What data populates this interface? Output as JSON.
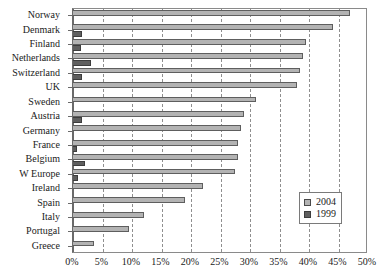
{
  "chart_data": {
    "type": "bar",
    "orientation": "horizontal",
    "title": "",
    "subtitle": "",
    "xlabel": "",
    "ylabel": "",
    "xlim": [
      0,
      50
    ],
    "xtick_step": 5,
    "grid": true,
    "grid_style": "dashed-vertical",
    "legend_position": "bottom-right",
    "categories": [
      "Norway",
      "Denmark",
      "Finland",
      "Netherlands",
      "Switzerland",
      "UK",
      "Sweden",
      "Austria",
      "Germany",
      "France",
      "Belgium",
      "W Europe",
      "Ireland",
      "Spain",
      "Italy",
      "Portugal",
      "Greece"
    ],
    "xticklabels": [
      "0%",
      "5%",
      "10%",
      "15%",
      "20%",
      "25%",
      "30%",
      "35%",
      "40%",
      "45%",
      "50%"
    ],
    "xtickvalues": [
      0,
      5,
      10,
      15,
      20,
      25,
      30,
      35,
      40,
      45,
      50
    ],
    "series": [
      {
        "name": "2004",
        "color": "#b3b3b3",
        "border_color": "#5e5e5e",
        "values": [
          47.0,
          44.0,
          39.5,
          39.0,
          38.5,
          38.0,
          31.0,
          29.0,
          28.5,
          28.0,
          28.0,
          27.5,
          22.0,
          19.0,
          12.0,
          9.5,
          3.5
        ]
      },
      {
        "name": "1999",
        "color": "#5f5f5f",
        "border_color": "#3d3d3d",
        "values": [
          0.0,
          1.5,
          1.3,
          3.0,
          1.6,
          0.0,
          0.0,
          1.6,
          0.0,
          0.7,
          2.0,
          0.8,
          0.0,
          0.0,
          0.0,
          0.0,
          0.0
        ]
      }
    ]
  },
  "legend": {
    "entries": [
      {
        "label": "2004",
        "swatch": "light-gray-square"
      },
      {
        "label": "1999",
        "swatch": "dark-gray-square"
      }
    ]
  },
  "colors": {
    "series_2004": "#b3b3b3",
    "series_1999": "#5f5f5f",
    "axis": "#6a6a6a",
    "gridline": "#8f8f8f",
    "text": "#1a1a1a",
    "background": "#ffffff"
  }
}
